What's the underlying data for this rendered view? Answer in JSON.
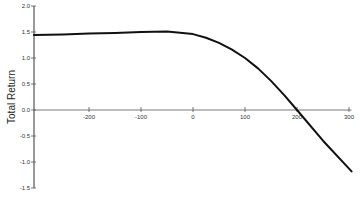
{
  "chart_data": {
    "type": "line",
    "title": "",
    "xlabel": "",
    "ylabel": "Total Return",
    "xlim": [
      -306,
      305
    ],
    "ylim": [
      -1.5,
      2.0
    ],
    "grid": false,
    "legend": null,
    "x_ticks": [
      -200,
      -100,
      0,
      100,
      200,
      300
    ],
    "x_tick_labels": [
      "-200",
      "-100",
      "0",
      "100",
      "200",
      "300"
    ],
    "y_ticks": [
      2.0,
      1.5,
      1.0,
      0.5,
      0.0,
      -0.5,
      -1.0,
      -1.5
    ],
    "y_tick_labels": [
      "2.0",
      "1.5",
      "1.0",
      "0.5",
      "0.0",
      "-0.5",
      "-1.0",
      "-1.5"
    ],
    "series": [
      {
        "name": "Total Return",
        "color": "#111111",
        "x": [
          -306,
          -250,
          -200,
          -150,
          -100,
          -50,
          0,
          25,
          50,
          75,
          100,
          125,
          150,
          175,
          200,
          250,
          305
        ],
        "values": [
          1.44,
          1.45,
          1.47,
          1.48,
          1.5,
          1.51,
          1.46,
          1.39,
          1.29,
          1.16,
          1.0,
          0.8,
          0.56,
          0.29,
          0.0,
          -0.59,
          -1.18
        ]
      }
    ]
  },
  "layout": {
    "plot_left": 34,
    "x_origin_px": 193,
    "px_per_x_unit": 0.52,
    "y_zero_px": 110,
    "px_per_y_unit": 52
  }
}
